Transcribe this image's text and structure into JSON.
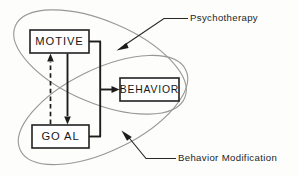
{
  "diagram": {
    "canvas": {
      "width": 298,
      "height": 176,
      "background": "#fdfdfc"
    },
    "colors": {
      "box_stroke": "#222020",
      "box_fill": "#ffffff",
      "ellipse_stroke": "#9a9894",
      "arrow": "#1d1c1b",
      "text": "#161514",
      "leader": "#2a2826"
    },
    "boxes": [
      {
        "id": "motive",
        "label": "MOTIVE",
        "x": 30,
        "y": 30,
        "w": 59,
        "h": 23
      },
      {
        "id": "goal",
        "label": "GO AL",
        "x": 32,
        "y": 125,
        "w": 57,
        "h": 23
      },
      {
        "id": "behavior",
        "label": "BEHAVIOR",
        "x": 120,
        "y": 78,
        "w": 59,
        "h": 23
      }
    ],
    "ellipses": [
      {
        "id": "psychotherapy",
        "label": "Psychotherapy",
        "cx": 100,
        "cy": 62,
        "rx": 92,
        "ry": 41,
        "rotation_deg": 23
      },
      {
        "id": "behavior-modification",
        "label": "Behavior Modification",
        "cx": 103,
        "cy": 110,
        "rx": 92,
        "ry": 41,
        "rotation_deg": -26
      }
    ],
    "connections": [
      {
        "id": "goal-to-motive",
        "from": "goal",
        "to": "motive",
        "style": "dashed",
        "direction": "up"
      },
      {
        "id": "motive-to-goal",
        "from": "motive",
        "to": "goal",
        "style": "solid",
        "direction": "down"
      },
      {
        "id": "motive-goal-to-behavior",
        "from": "motive-and-goal",
        "to": "behavior",
        "style": "solid",
        "direction": "right"
      }
    ],
    "annotations": [
      {
        "id": "psychotherapy-annotation",
        "text": "Psychotherapy",
        "text_x": 190,
        "text_y": 18,
        "points_to": "psychotherapy-ellipse"
      },
      {
        "id": "behavior-modification-annotation",
        "text": "Behavior Modification",
        "text_x": 178,
        "text_y": 159,
        "points_to": "behavior-modification-ellipse"
      }
    ]
  }
}
